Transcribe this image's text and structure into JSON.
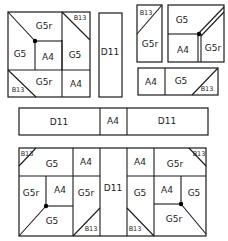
{
  "diagram": {
    "title": "",
    "colors": {
      "line": "#1a1a1a",
      "background": "#ffffff",
      "dot": "#000000"
    },
    "pieces": {
      "top_left_block": {
        "labels": {
          "g5r_top": "G5r",
          "b13_top": "B13",
          "g5_left": "G5",
          "a4_center": "A4",
          "g5_right": "G5",
          "b13_bottom": "B13",
          "g5r_bottom": "G5r",
          "a4_bottom": "A4"
        }
      },
      "tall_strip": {
        "label": "D11"
      },
      "top_right_narrow": {
        "b13": "B13",
        "g5r": "G5r"
      },
      "top_right_block": {
        "g5": "G5",
        "a4": "A4",
        "g5r": "G5r"
      },
      "top_right_strip": {
        "a4": "A4",
        "g5": "G5",
        "b13": "B13"
      },
      "middle_strip": {
        "d11_left": "D11",
        "a4": "A4",
        "d11_right": "D11"
      },
      "bottom_block": {
        "left": {
          "b13_top": "B13",
          "g5_top": "G5",
          "a4_top": "A4",
          "g5r_mid": "G5r",
          "a4_mid": "A4",
          "g5r_right": "G5r",
          "g5_bottom": "G5",
          "b13_bottom": "B13"
        },
        "center": {
          "d11": "D11"
        },
        "right": {
          "a4_top": "A4",
          "g5r_top": "G5r",
          "b13_top": "B13",
          "g5_left": "G5",
          "a4_mid": "A4",
          "g5_mid": "G5",
          "b13_bottom": "B13",
          "g5r_bottom": "G5r"
        }
      }
    }
  }
}
